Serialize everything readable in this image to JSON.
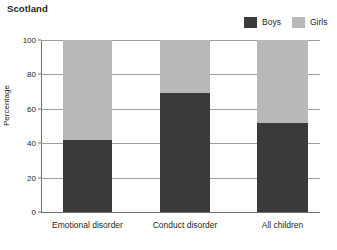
{
  "chart_data": {
    "type": "bar",
    "subtype": "stacked-100",
    "title": "Scotland",
    "xlabel": "",
    "ylabel": "Percentage",
    "ylim": [
      0,
      100
    ],
    "yticks": [
      0,
      20,
      40,
      60,
      80,
      100
    ],
    "grid": true,
    "legend_position": "top-right",
    "categories": [
      "Emotional disorder",
      "Conduct disorder",
      "All children"
    ],
    "series": [
      {
        "name": "Boys",
        "color": "#3a3a3a",
        "values": [
          42,
          69,
          52
        ]
      },
      {
        "name": "Girls",
        "color": "#b8b8b8",
        "values": [
          58,
          31,
          48
        ]
      }
    ]
  },
  "colors": {
    "boys": "#3a3a3a",
    "girls": "#b8b8b8",
    "grid": "#9d9d9d",
    "axis": "#6f6f6f",
    "text": "#231f20",
    "background": "#ffffff"
  }
}
